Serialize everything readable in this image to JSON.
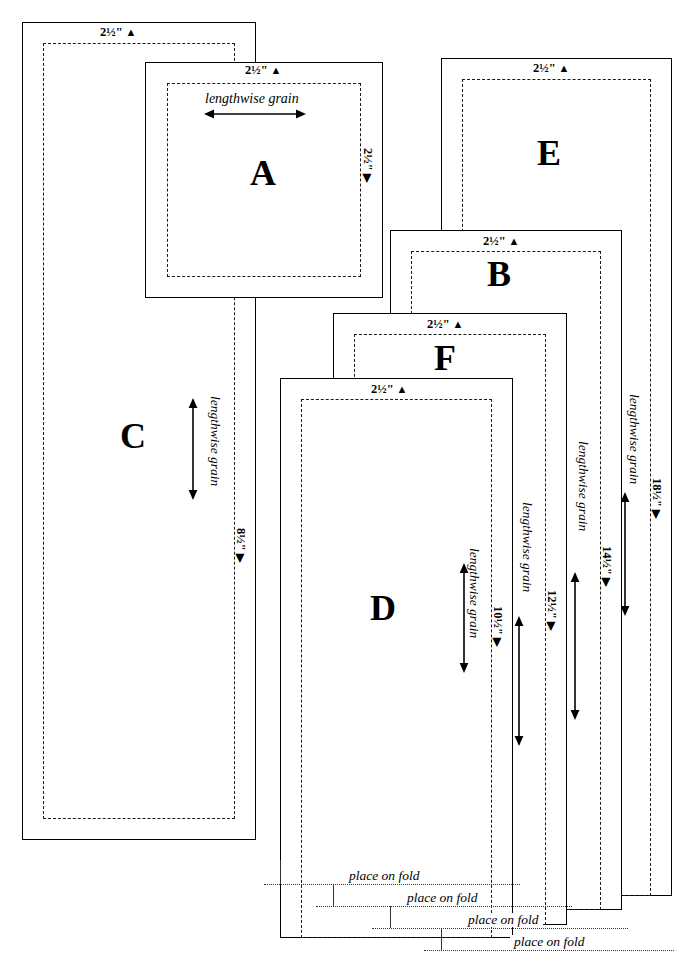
{
  "document": {
    "title": "Cutting layout diagram — pattern pieces A–F",
    "type": "sewing-pattern-cutting-diagram"
  },
  "labels": {
    "seam_allowance": "2½\"",
    "grain": "lengthwise grain",
    "fold": "place on fold",
    "triangle_up": "▲",
    "triangle_right": "▶"
  },
  "pieces": [
    {
      "id": "C",
      "letter": "C",
      "sa_top": "2½\"",
      "sa_side": "8½\"",
      "grain": "lengthwise grain",
      "grain_dir": "vertical",
      "fold": null
    },
    {
      "id": "A",
      "letter": "A",
      "sa_top": "2½\"",
      "sa_side": "2½\"",
      "grain": "lengthwise grain",
      "grain_dir": "horizontal",
      "fold": null
    },
    {
      "id": "E",
      "letter": "E",
      "sa_top": "2½\"",
      "sa_side": "18½\"",
      "grain": "lengthwise grain",
      "grain_dir": "vertical",
      "fold": "place on fold"
    },
    {
      "id": "B",
      "letter": "B",
      "sa_top": "2½\"",
      "sa_side": "14½\"",
      "grain": "lengthwise grain",
      "grain_dir": "vertical",
      "fold": "place on fold"
    },
    {
      "id": "F",
      "letter": "F",
      "sa_top": "2½\"",
      "sa_side": "12½\"",
      "grain": "lengthwise grain",
      "grain_dir": "vertical",
      "fold": "place on fold"
    },
    {
      "id": "D",
      "letter": "D",
      "sa_top": "2½\"",
      "sa_side": "10½\"",
      "grain": "lengthwise grain",
      "grain_dir": "vertical",
      "fold": "place on fold"
    }
  ],
  "fold_notes": [
    {
      "text": "place on fold"
    },
    {
      "text": "place on fold"
    },
    {
      "text": "place on fold"
    },
    {
      "text": "place on fold"
    }
  ],
  "colors": {
    "ink": "#000000",
    "paper": "#ffffff",
    "dash": "#1a1a1a",
    "dot": "#333333"
  }
}
